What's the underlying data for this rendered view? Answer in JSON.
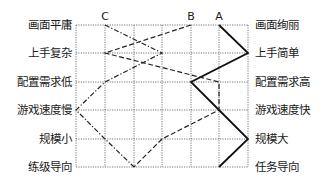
{
  "chart_data": {
    "type": "line",
    "title": "",
    "orientation": "profile-diagram (attributes on rows, scale left-to-right)",
    "left_labels": [
      "画面平庸",
      "上手复杂",
      "配置需求低",
      "游戏速度慢",
      "规模小",
      "练级导向"
    ],
    "right_labels": [
      "画面绚丽",
      "上手简单",
      "配置需求高",
      "游戏速度快",
      "规模大",
      "任务导向"
    ],
    "scale_positions": 7,
    "scale_range": [
      0,
      6
    ],
    "grid": true,
    "series": [
      {
        "name": "A",
        "style": "solid",
        "color": "#111111",
        "values": [
          5,
          6,
          4,
          5,
          6,
          5
        ]
      },
      {
        "name": "B",
        "style": "dashed",
        "color": "#222222",
        "values": [
          4,
          1,
          5,
          5,
          3,
          2
        ]
      },
      {
        "name": "C",
        "style": "dash-dot",
        "color": "#222222",
        "values": [
          1,
          3,
          1,
          0,
          1,
          2
        ]
      }
    ]
  },
  "layout": {
    "x_positions": [
      76,
      105,
      134,
      162,
      191,
      219,
      248
    ],
    "y_positions": [
      25,
      53,
      82,
      110,
      139,
      167
    ]
  }
}
